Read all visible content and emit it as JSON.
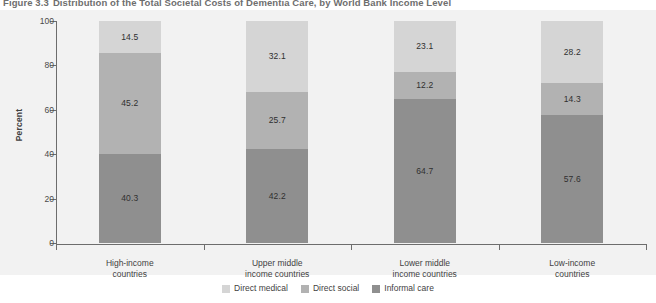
{
  "figure": {
    "number": "Figure 3.3",
    "title": "Distribution of the Total Societal Costs of Dementia Care, by World Bank Income Level"
  },
  "chart_data": {
    "type": "bar",
    "stacked": true,
    "title": "Distribution of the Total Societal Costs of Dementia Care, by World Bank Income Level",
    "xlabel": "",
    "ylabel": "Percent",
    "ylim": [
      0,
      100
    ],
    "yticks": [
      0,
      20,
      40,
      60,
      80,
      100
    ],
    "grid": false,
    "legend_position": "bottom",
    "categories": [
      "High-income countries",
      "Upper middle income countries",
      "Lower middle income countries",
      "Low-income countries"
    ],
    "category_lines": [
      [
        "High-income",
        "countries"
      ],
      [
        "Upper middle",
        "income countries"
      ],
      [
        "Lower middle",
        "income countries"
      ],
      [
        "Low-income",
        "countries"
      ]
    ],
    "series": [
      {
        "name": "Direct medical",
        "color": "#d5d5d5",
        "values": [
          14.5,
          32.1,
          23.1,
          28.2
        ]
      },
      {
        "name": "Direct social",
        "color": "#b2b2b2",
        "values": [
          45.2,
          25.7,
          12.2,
          14.3
        ]
      },
      {
        "name": "Informal care",
        "color": "#8f8f8f",
        "values": [
          40.3,
          42.2,
          64.7,
          57.6
        ]
      }
    ]
  },
  "colors": {
    "plot_background": "#f2f2f2",
    "page_background": "#ffffff",
    "axis": "#6d6d6d",
    "direct_medical": "#d5d5d5",
    "direct_social": "#b2b2b2",
    "informal_care": "#8f8f8f"
  }
}
